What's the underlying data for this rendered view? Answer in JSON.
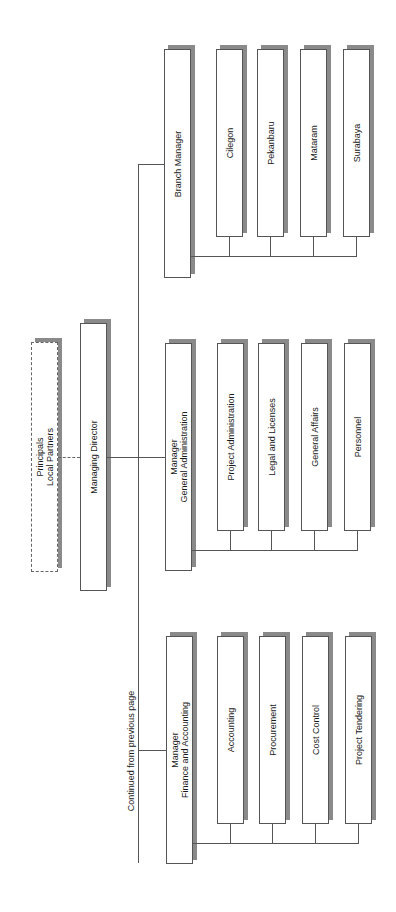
{
  "chart": {
    "orientation": "rotated-90-ccw",
    "continued_note": "Continued from previous page",
    "colors": {
      "line": "#555555",
      "shadow": "#8a8a8a",
      "box_fill": "#ffffff"
    }
  },
  "nodes": {
    "principals": {
      "line1": "Principals",
      "line2": "Local Partners",
      "style": "dashed"
    },
    "managing_director": {
      "label": "Managing Director"
    },
    "branch_manager": {
      "label": "Branch Manager"
    },
    "ga_manager": {
      "line1": "Manager",
      "line2": "General Administration"
    },
    "fa_manager": {
      "line1": "Manager",
      "line2": "Finance and Accounting"
    }
  },
  "branch_children": [
    {
      "label": "Cilegon"
    },
    {
      "label": "Pekanbaru"
    },
    {
      "label": "Mataram"
    },
    {
      "label": "Surabaya"
    }
  ],
  "ga_children": [
    {
      "label": "Project Administration"
    },
    {
      "label": "Legal and Licenses"
    },
    {
      "label": "General Affairs"
    },
    {
      "label": "Personnel"
    }
  ],
  "fa_children": [
    {
      "label": "Accounting"
    },
    {
      "label": "Procurement"
    },
    {
      "label": "Cost Control"
    },
    {
      "label": "Project Tendering"
    }
  ]
}
